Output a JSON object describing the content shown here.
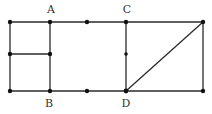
{
  "diagram": {
    "type": "geometry-figure",
    "stroke_color": "#2a2a2a",
    "point_color": "#111111",
    "labels": {
      "A": "A",
      "B": "B",
      "C": "C",
      "D": "D"
    },
    "points": [
      {
        "id": "TL",
        "x": 10,
        "y": 22
      },
      {
        "id": "A",
        "x": 50,
        "y": 22
      },
      {
        "id": "T1",
        "x": 87,
        "y": 22
      },
      {
        "id": "C",
        "x": 126,
        "y": 22
      },
      {
        "id": "TR",
        "x": 203,
        "y": 22
      },
      {
        "id": "ML",
        "x": 10,
        "y": 54
      },
      {
        "id": "MA",
        "x": 50,
        "y": 54
      },
      {
        "id": "MC",
        "x": 126,
        "y": 54
      },
      {
        "id": "BL",
        "x": 10,
        "y": 91
      },
      {
        "id": "B",
        "x": 50,
        "y": 91
      },
      {
        "id": "B1",
        "x": 87,
        "y": 91
      },
      {
        "id": "D",
        "x": 126,
        "y": 91
      },
      {
        "id": "BR",
        "x": 203,
        "y": 91
      }
    ],
    "segments": [
      [
        "TL",
        "TR"
      ],
      [
        "BL",
        "BR"
      ],
      [
        "TL",
        "BL"
      ],
      [
        "A",
        "B"
      ],
      [
        "ML",
        "MA"
      ],
      [
        "C",
        "D"
      ],
      [
        "TR",
        "BR"
      ],
      [
        "D",
        "TR"
      ]
    ]
  }
}
